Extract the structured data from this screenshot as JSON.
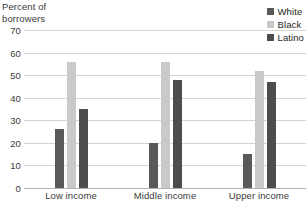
{
  "chart_data": {
    "type": "bar",
    "title": "",
    "ylabel": "Percent of\nborrowers",
    "xlabel": "",
    "categories": [
      "Low income",
      "Middle income",
      "Upper income"
    ],
    "series": [
      {
        "name": "White",
        "color": "#595959",
        "values": [
          26,
          20,
          15
        ]
      },
      {
        "name": "Black",
        "color": "#c9c9c9",
        "values": [
          56,
          56,
          52
        ]
      },
      {
        "name": "Latino",
        "color": "#4d4d4d",
        "values": [
          35,
          48,
          47
        ]
      }
    ],
    "ylim": [
      0,
      70
    ],
    "yticks": [
      70,
      60,
      50,
      40,
      30,
      20,
      10,
      0
    ],
    "grid": true,
    "legend_position": "top-right"
  },
  "colors": {
    "grid": "#d4d4d4",
    "axis": "#b0b0b0",
    "text": "#3a3a3a"
  }
}
